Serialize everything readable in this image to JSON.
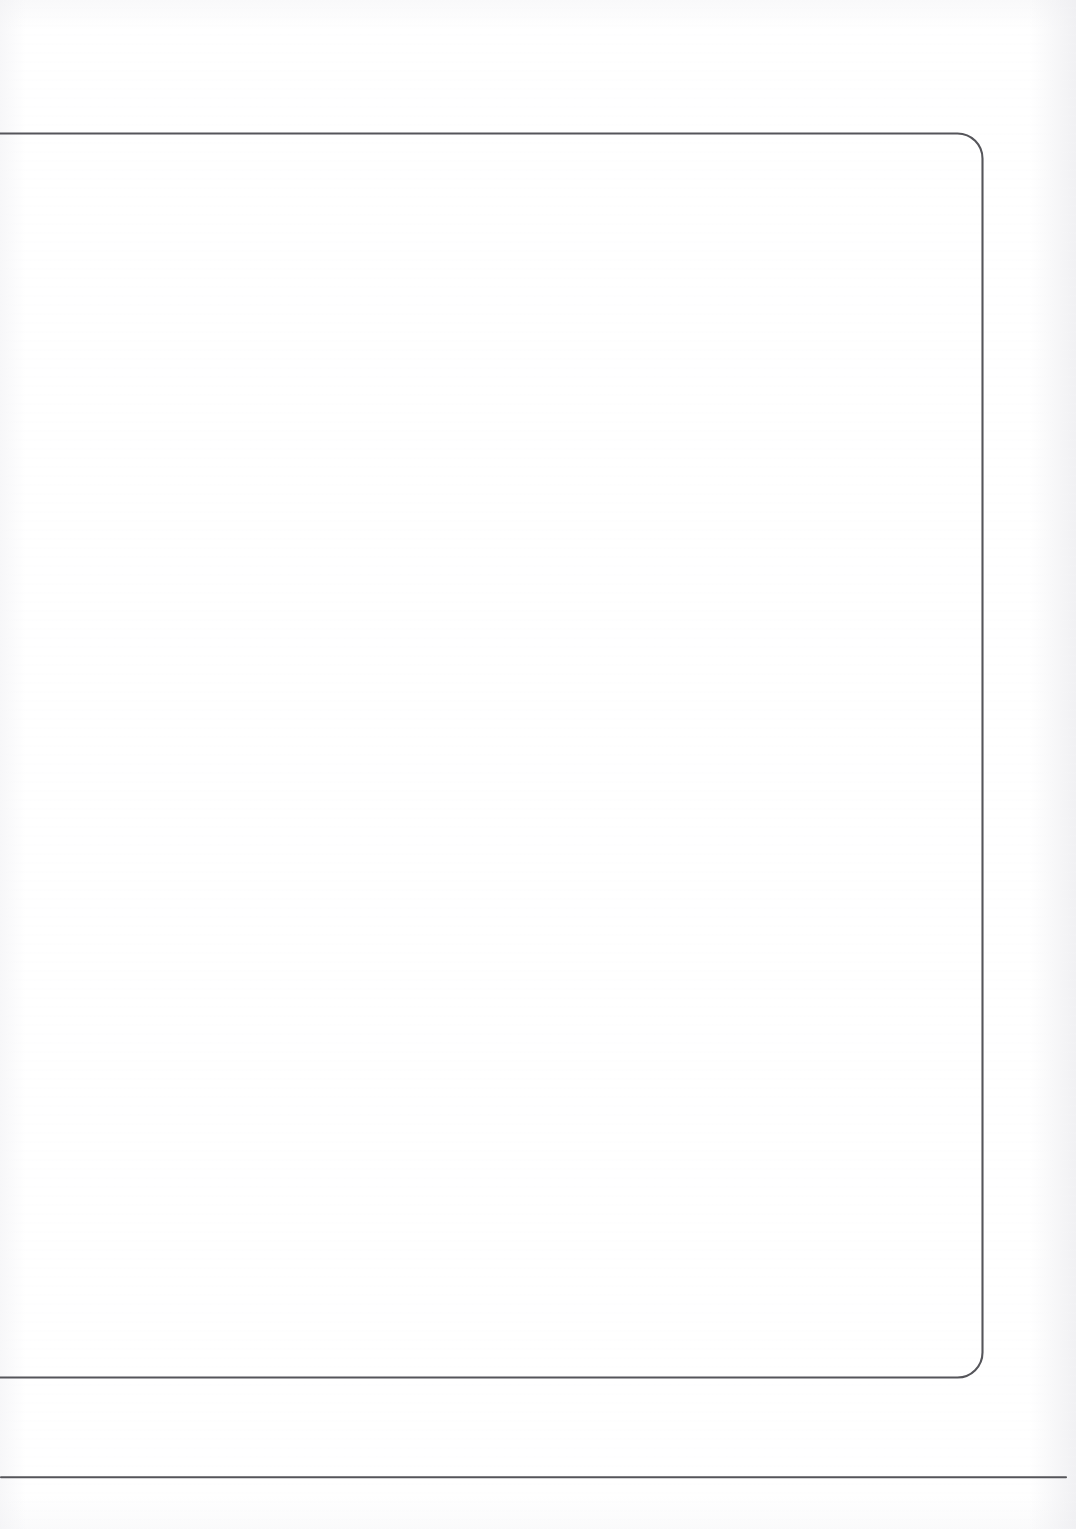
{
  "document": {
    "kind": "scanned-blank-page",
    "page_width": 1076,
    "page_height": 1529,
    "background_color": "#ffffff",
    "ink_color": "#55555a",
    "body_text": "",
    "caption": ""
  },
  "frame": {
    "name": "rounded-rectangle-border",
    "description": "",
    "corner_radius": 25,
    "stroke_width": 2,
    "stroke_color": "#55555a",
    "top_y": 133,
    "bottom_y": 1377,
    "right_x": 983,
    "left_clipped": true
  },
  "footer_rule": {
    "name": "horizontal-rule",
    "y": 1477,
    "start_x": 0,
    "end_x": 1066,
    "stroke_width": 2,
    "stroke_color": "#55555a"
  },
  "regions": {
    "top_margin_label": "",
    "content_label": "",
    "footer_label": "",
    "bottom_margin_label": "",
    "right_margin_label": ""
  }
}
